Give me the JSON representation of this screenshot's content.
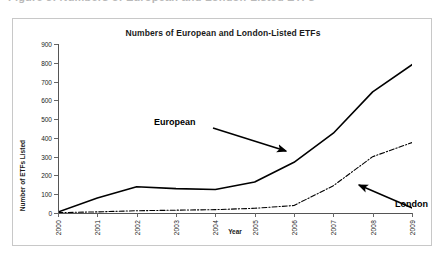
{
  "page": {
    "clipped_top_text": "Figure 3: Numbers of European and London-Listed ETFs"
  },
  "chart_data": {
    "type": "line",
    "title": "Numbers of European and London-Listed ETFs",
    "xlabel": "Year",
    "ylabel": "Number of ETFs Listed",
    "categories": [
      "2000",
      "2001",
      "2002",
      "2003",
      "2004",
      "2005",
      "2006",
      "2007",
      "2008",
      "2009"
    ],
    "ylim": [
      0,
      900
    ],
    "yticks": [
      0,
      100,
      200,
      300,
      400,
      500,
      600,
      700,
      800,
      900
    ],
    "grid": false,
    "legend": "none",
    "series": [
      {
        "name": "European",
        "style": "solid",
        "color": "#000000",
        "values": [
          5,
          80,
          140,
          130,
          125,
          165,
          270,
          425,
          645,
          790
        ]
      },
      {
        "name": "London",
        "style": "dash-dot",
        "color": "#000000",
        "values": [
          2,
          6,
          12,
          15,
          18,
          25,
          40,
          145,
          300,
          375
        ]
      }
    ],
    "annotations": [
      {
        "text": "European",
        "points_to_series": "European",
        "arrow": "right-down"
      },
      {
        "text": "London",
        "points_to_series": "London",
        "arrow": "left-up"
      }
    ]
  }
}
